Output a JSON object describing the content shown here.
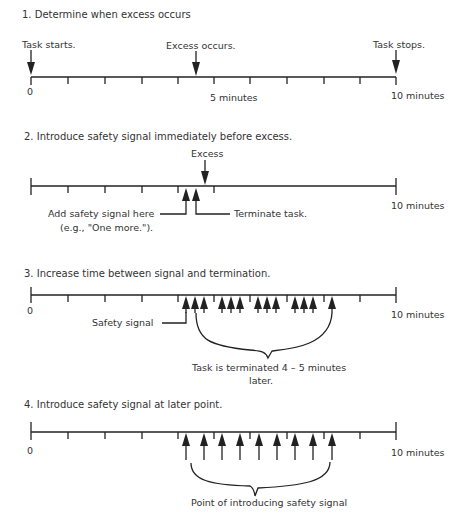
{
  "axis": {
    "x0": 31,
    "x10": 396,
    "major_ticks": [
      31,
      68,
      105,
      142,
      178,
      214,
      250,
      287,
      324,
      360,
      396
    ]
  },
  "panels": [
    {
      "id": "panel-1",
      "heading": "1.  Determine when excess occurs",
      "line_y": 77,
      "ticks": [
        31,
        68,
        105,
        142,
        178,
        214,
        250,
        287,
        324,
        360,
        396
      ],
      "labels": {
        "zero": "0",
        "five": "5 minutes",
        "ten": "10 minutes"
      },
      "down_arrows": [
        {
          "x": 31,
          "label": "Task starts."
        },
        {
          "x": 196,
          "label": "Excess occurs."
        },
        {
          "x": 396,
          "label": "Task stops."
        }
      ]
    },
    {
      "id": "panel-2",
      "heading": "2.  Introduce safety signal immediately before excess.",
      "line_y": 186,
      "ticks": [
        31,
        68,
        105,
        142,
        178,
        214,
        396
      ],
      "labels": {
        "ten": "10 minutes"
      },
      "excess_label": "Excess",
      "excess_x": 205,
      "up_arrows": [
        186,
        196
      ],
      "signal_label_line1": "Add safety signal here",
      "signal_label_line2": "(e.g., \"One more.\").",
      "terminate_label": "Terminate task."
    },
    {
      "id": "panel-3",
      "heading": "3.  Increase time between signal and termination.",
      "line_y": 295,
      "ticks": [
        31,
        68,
        105,
        142,
        178,
        214,
        250,
        287,
        324,
        360,
        396
      ],
      "labels": {
        "zero": "0",
        "ten": "10 minutes"
      },
      "up_arrows": [
        186,
        195,
        204,
        222,
        231,
        240,
        258,
        267,
        276,
        295,
        304,
        313,
        332
      ],
      "safety_label": "Safety signal",
      "brace_label_line1": "Task is terminated 4 – 5 minutes",
      "brace_label_line2": "later."
    },
    {
      "id": "panel-4",
      "heading": "4.  Introduce safety signal at later point.",
      "line_y": 432,
      "ticks": [
        31,
        68,
        105,
        142,
        178,
        214,
        250,
        287,
        324,
        360,
        396
      ],
      "labels": {
        "zero": "0",
        "ten": "10 minutes"
      },
      "up_arrows": [
        186,
        204,
        222,
        240,
        259,
        277,
        295,
        313,
        332
      ],
      "brace_label": "Point of introducing safety signal"
    }
  ]
}
